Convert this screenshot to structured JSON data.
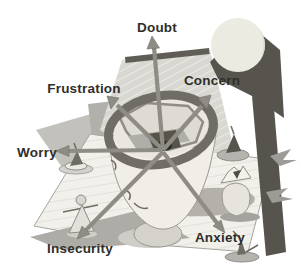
{
  "arrows": [
    {
      "label": "Doubt",
      "direction": "up"
    },
    {
      "label": "Frustration",
      "direction": "upper-left"
    },
    {
      "label": "Concern",
      "direction": "upper-right"
    },
    {
      "label": "Worry",
      "direction": "left"
    },
    {
      "label": "Insecurity",
      "direction": "lower-left"
    },
    {
      "label": "Anxiety",
      "direction": "lower-right"
    }
  ],
  "scene": {
    "center_object": "open-head-vessel-with-maze-interior",
    "decorations": [
      "sun-disc",
      "tilted-hatched-planes",
      "dark-slab",
      "spinning-top-left",
      "spinning-top-right",
      "spinning-top-bottom",
      "cone-figure",
      "paper-boat-on-vase"
    ]
  },
  "colors": {
    "background": "#ffffff",
    "label_text": "#2f2e2a",
    "arrow": "#8e8c84",
    "arrow_edge": "#72706a",
    "ring": "#6f6d66",
    "slab": "#56544d",
    "bar": "#5f5d56",
    "sheet": "#d9d7d1",
    "sheet_hatch": "#eae8e2",
    "floor": "#f2f0ea",
    "floor_hatch": "#e0ded8",
    "floor_edge": "#a5a39e",
    "gray_plane": "#c3c1bb",
    "gray_plane2": "#b2b0aa",
    "under_sheet": "#aeaca6",
    "head": "#f0eee7",
    "head_line": "#9a9891",
    "interior": "#e9e7e0",
    "wall_fill": "#dddbd4",
    "wall_line": "#8f8d86",
    "shelf": "#b0aea8",
    "pit": "#565449",
    "hub": "#2e2c28",
    "shadow": "#b3b1aa",
    "shadow_light": "#cfcdc7",
    "sun": "#ecebe2",
    "object_light": "#eceae4",
    "object_mid": "#b5b3ad",
    "object_dark": "#6e6c65",
    "face_line": "#6e6c65"
  }
}
